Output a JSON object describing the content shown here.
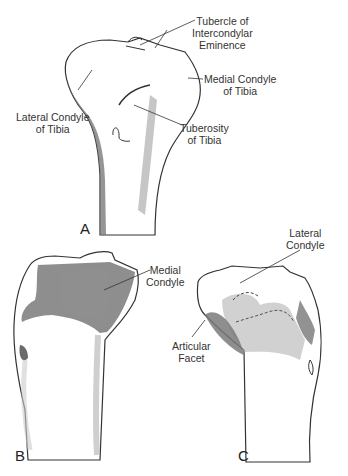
{
  "figure": {
    "panels": [
      {
        "id": "A",
        "label": "A"
      },
      {
        "id": "B",
        "label": "B"
      },
      {
        "id": "C",
        "label": "C"
      }
    ],
    "labels": {
      "tubercle_line1": "Tubercle of",
      "tubercle_line2": "Intercondylar",
      "tubercle_line3": "Eminence",
      "medial_condyle_tibia_line1": "Medial Condyle",
      "medial_condyle_tibia_line2": "of Tibia",
      "lateral_condyle_tibia_line1": "Lateral Condyle",
      "lateral_condyle_tibia_line2": "of Tibia",
      "tuberosity_line1": "Tuberosity",
      "tuberosity_line2": "of Tibia",
      "medial_condyle_line1": "Medial",
      "medial_condyle_line2": "Condyle",
      "lateral_condyle_line1": "Lateral",
      "lateral_condyle_line2": "Condyle",
      "articular_facet_line1": "Articular",
      "articular_facet_line2": "Facet"
    },
    "colors": {
      "outline": "#333333",
      "shade_dark": "#7a7a7a",
      "shade_mid": "#9a9a9a",
      "shade_light": "#c8c8c8"
    }
  }
}
